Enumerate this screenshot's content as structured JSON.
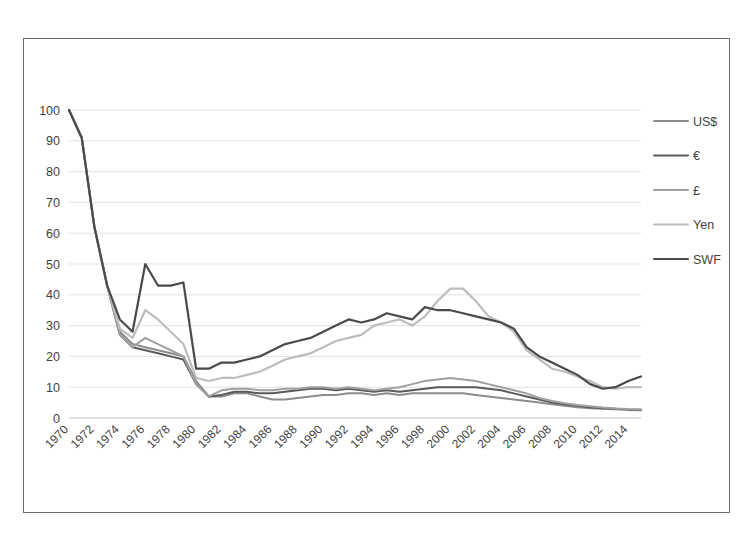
{
  "chart_data": {
    "type": "line",
    "title": "",
    "subtitle": "",
    "xlabel": "",
    "ylabel": "",
    "ylim": [
      0,
      100
    ],
    "yticks": [
      0,
      10,
      20,
      30,
      40,
      50,
      60,
      70,
      80,
      90,
      100
    ],
    "grid": true,
    "legend_position": "right",
    "x_start": 1970,
    "x_end": 2015,
    "xtick_labels": [
      "1970",
      "1972",
      "1974",
      "1976",
      "1978",
      "1980",
      "1982",
      "1984",
      "1986",
      "1988",
      "1990",
      "1992",
      "1994",
      "1996",
      "1998",
      "2000",
      "2002",
      "2004",
      "2006",
      "2008",
      "2010",
      "2012",
      "2014"
    ],
    "x": [
      1970,
      1971,
      1972,
      1973,
      1974,
      1975,
      1976,
      1977,
      1978,
      1979,
      1980,
      1981,
      1982,
      1983,
      1984,
      1985,
      1986,
      1987,
      1988,
      1989,
      1990,
      1991,
      1992,
      1993,
      1994,
      1995,
      1996,
      1997,
      1998,
      1999,
      2000,
      2001,
      2002,
      2003,
      2004,
      2005,
      2006,
      2007,
      2008,
      2009,
      2010,
      2011,
      2012,
      2013,
      2014,
      2015
    ],
    "series": [
      {
        "name": "US$",
        "color": "#8c8c8c",
        "width": 2.0,
        "values": [
          100,
          91,
          62,
          43,
          28,
          24,
          23,
          22,
          21,
          20,
          12,
          7,
          7,
          8,
          8,
          7,
          6,
          6,
          6.5,
          7,
          7.5,
          7.5,
          8,
          8,
          7.5,
          8,
          7.5,
          8,
          8,
          8,
          8,
          8,
          7.5,
          7,
          6.5,
          6,
          5.5,
          5,
          4.5,
          4,
          3.5,
          3.2,
          3,
          2.8,
          2.6,
          2.5
        ]
      },
      {
        "name": "€",
        "color": "#5a5a5a",
        "width": 2.0,
        "values": [
          100,
          91,
          62,
          43,
          27,
          23,
          22,
          21,
          20,
          19,
          11,
          7,
          7.5,
          8.5,
          8.5,
          8,
          8,
          8.5,
          9,
          9.5,
          9.5,
          9,
          9.5,
          9,
          8.5,
          9,
          8.5,
          9,
          9.5,
          10,
          10,
          10,
          10,
          9.5,
          9,
          8,
          7,
          6,
          5,
          4.5,
          4,
          3.5,
          3.2,
          3,
          2.8,
          2.7
        ]
      },
      {
        "name": "£",
        "color": "#a0a0a0",
        "width": 2.0,
        "values": [
          100,
          91,
          62,
          43,
          27,
          23,
          26,
          24,
          22,
          20,
          11,
          7,
          9,
          9.5,
          9.5,
          9,
          9,
          9.5,
          9.5,
          10,
          10,
          9.5,
          10,
          9.5,
          9,
          9.5,
          10,
          11,
          12,
          12.5,
          13,
          12.5,
          12,
          11,
          10,
          9,
          8,
          6.5,
          5.5,
          4.8,
          4.2,
          3.8,
          3.4,
          3.1,
          2.9,
          2.8
        ]
      },
      {
        "name": "Yen",
        "color": "#bdbdbd",
        "width": 2.2,
        "values": [
          100,
          91,
          62,
          43,
          29,
          26,
          35,
          32,
          28,
          24,
          13,
          12,
          13,
          13,
          14,
          15,
          17,
          19,
          20,
          21,
          23,
          25,
          26,
          27,
          30,
          31,
          32,
          30,
          33,
          38,
          42,
          42,
          38,
          33,
          31,
          28,
          22,
          19,
          16,
          15,
          13.5,
          12,
          10,
          9.5,
          10,
          10
        ]
      },
      {
        "name": "SWF",
        "color": "#4a4a4a",
        "width": 2.2,
        "values": [
          100,
          91,
          62,
          43,
          32,
          28,
          50,
          43,
          43,
          44,
          16,
          16,
          18,
          18,
          19,
          20,
          22,
          24,
          25,
          26,
          28,
          30,
          32,
          31,
          32,
          34,
          33,
          32,
          36,
          35,
          35,
          34,
          33,
          32,
          31,
          29,
          23,
          20,
          18,
          16,
          14,
          11,
          9.5,
          10,
          12,
          13.5
        ]
      }
    ]
  },
  "legend": {
    "entries": [
      {
        "label": "US$"
      },
      {
        "label": "€"
      },
      {
        "label": "£"
      },
      {
        "label": "Yen"
      },
      {
        "label": "SWF"
      }
    ]
  },
  "colors": {
    "frame": "#6b6b6b",
    "grid": "#d9d9d9",
    "text": "#3f3f3f",
    "background": "#ffffff"
  }
}
